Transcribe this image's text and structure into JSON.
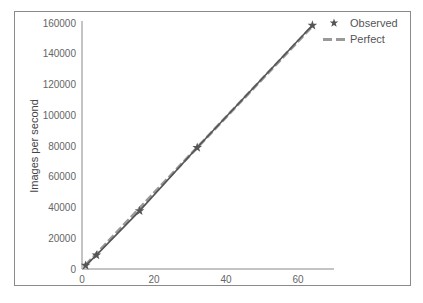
{
  "chart_data": {
    "type": "line",
    "title": "",
    "xlabel": "",
    "ylabel": "Images per second",
    "xlim": [
      0,
      70
    ],
    "ylim": [
      0,
      160000
    ],
    "x_ticks": [
      "0",
      "20",
      "40",
      "60"
    ],
    "y_ticks": [
      "0",
      "20000",
      "40000",
      "60000",
      "80000",
      "100000",
      "120000",
      "140000",
      "160000"
    ],
    "grid": false,
    "legend_position": "upper right (outside)",
    "series": [
      {
        "name": "Observed",
        "style": "star markers",
        "x": [
          1,
          4,
          16,
          32,
          64
        ],
        "values": [
          2300,
          9000,
          37800,
          79000,
          158500
        ]
      },
      {
        "name": "Perfect",
        "style": "dashed line",
        "x": [
          1,
          64
        ],
        "values": [
          2470,
          158000
        ]
      }
    ]
  },
  "legend": {
    "observed_label": "Observed",
    "perfect_label": "Perfect"
  },
  "axes": {
    "ylabel": "Images per second"
  }
}
